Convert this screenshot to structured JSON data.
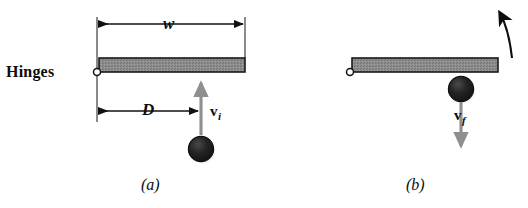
{
  "figure": {
    "colors": {
      "ink": "#0d0d0d",
      "bar_fill": "#8a8a8a",
      "bar_stroke": "#1a1a1a",
      "ball_fill": "#1c1c1c",
      "ball_highlight": "#f2f2f2",
      "velocity_arrow": "#8f8f8f",
      "dimension_arrow": "#111111",
      "background": "#ffffff"
    }
  },
  "panel_a": {
    "caption": "(a)",
    "hinges_label": "Hinges",
    "width_label": "w",
    "distance_label": "D",
    "velocity": {
      "symbol": "v",
      "subscript": "i"
    },
    "elements": {
      "bar": "door-plank",
      "pivot": "hinge-pivot",
      "ball": "ball-projectile",
      "velocity_arrow_direction": "up",
      "width_extent": "full plank width",
      "distance_extent": "hinge to impact point"
    }
  },
  "panel_b": {
    "caption": "(b)",
    "velocity": {
      "symbol": "v",
      "subscript": "f"
    },
    "elements": {
      "bar": "door-plank",
      "pivot": "hinge-pivot",
      "ball": "ball-projectile",
      "velocity_arrow_direction": "down",
      "rotation_arrow": "curved-arrow-counterclockwise"
    }
  }
}
